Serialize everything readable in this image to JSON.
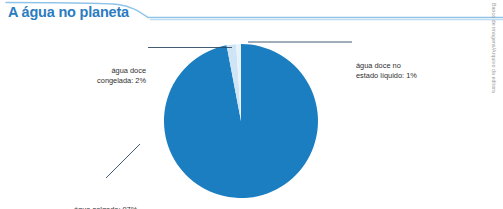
{
  "header": {
    "title": "A água no planeta",
    "title_color": "#2b7cc0",
    "rule_color": "#8fc4e8"
  },
  "credit": {
    "text": "Banco de imagens/Arquivo da editora"
  },
  "labels": {
    "frozen": {
      "line1": "água doce",
      "line2": "congelada: 2%"
    },
    "liquid": {
      "line1": "água doce no",
      "line2": "estado líquido: 1%"
    },
    "salt": {
      "line1": "água salgada: 97%",
      "line2": ""
    }
  },
  "chart_data": {
    "type": "pie",
    "title": "A água no planeta",
    "xlabel": "",
    "ylabel": "",
    "unit": "%",
    "legend_position": "callout-labels",
    "grid": false,
    "categories": [
      "água salgada",
      "água doce congelada",
      "água doce no estado líquido"
    ],
    "values": [
      97,
      2,
      1
    ],
    "colors": [
      "#1a7ec0",
      "#cfe4f5",
      "#e8f2fb"
    ],
    "labels": [
      "água salgada: 97%",
      "água doce congelada: 2%",
      "água doce no estado líquido: 1%"
    ],
    "start_angle_deg": -90,
    "direction": "clockwise",
    "geometry": {
      "center_x": 241,
      "center_y": 93,
      "radius": 77
    }
  }
}
